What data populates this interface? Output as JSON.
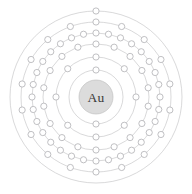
{
  "diagram": {
    "kind": "bohr-electron-shell-diagram",
    "element_symbol": "Au",
    "element_name": "Gold",
    "atomic_number": 79,
    "background_color": "#ffffff",
    "nucleus": {
      "label": "Au",
      "fill_color": "#dcdcdc",
      "stroke_color": "#c2c2c2",
      "text_color": "#3a3a3a",
      "radius": 17
    },
    "center": {
      "cx": 96,
      "cy": 97
    },
    "ring_color": "#b9b9bb",
    "electron_fill_color": "#ffffff",
    "electron_stroke_color": "#b0b0b4",
    "electron_radius": 3.1,
    "shells": [
      {
        "name": "K",
        "index": 1,
        "electrons": 2,
        "radius": 27,
        "start_angle": -90
      },
      {
        "name": "L",
        "index": 2,
        "electrons": 8,
        "radius": 40,
        "start_angle": -90
      },
      {
        "name": "M",
        "index": 3,
        "electrons": 18,
        "radius": 53,
        "start_angle": -90
      },
      {
        "name": "N",
        "index": 4,
        "electrons": 32,
        "radius": 64,
        "start_angle": -90
      },
      {
        "name": "O",
        "index": 5,
        "electrons": 18,
        "radius": 75,
        "start_angle": -90
      },
      {
        "name": "P",
        "index": 6,
        "electrons": 1,
        "radius": 86,
        "start_angle": -90
      }
    ],
    "shell_configuration": "2, 8, 18, 32, 18, 1"
  }
}
